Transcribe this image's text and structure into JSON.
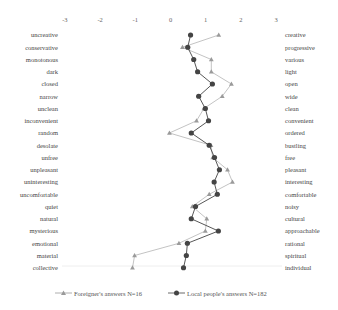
{
  "chart_data": {
    "type": "line",
    "subtype": "semantic-differential",
    "title": "",
    "xlabel": "",
    "ylabel": "",
    "xlim": [
      -3,
      3
    ],
    "x_ticks": [
      "-3",
      "-2",
      "-1",
      "0",
      "1",
      "2",
      "3"
    ],
    "grid": false,
    "legend_position": "bottom",
    "left_labels": [
      "uncreative",
      "conservative",
      "monotonous",
      "dark",
      "closed",
      "narrow",
      "unclean",
      "inconvenient",
      "random",
      "desolate",
      "unfree",
      "unpleasant",
      "uninteresting",
      "uncomfortable",
      "quiet",
      "natural",
      "mysterious",
      "emotional",
      "material",
      "collective"
    ],
    "right_labels": [
      "creative",
      "progressive",
      "various",
      "light",
      "open",
      "wide",
      "clean",
      "convenient",
      "ordered",
      "bustling",
      "free",
      "pleasant",
      "interesting",
      "comfortable",
      "noisy",
      "cultural",
      "approachable",
      "rational",
      "spiritual",
      "individual"
    ],
    "series": [
      {
        "name": "Foreigner's answers N=16",
        "marker": "triangle",
        "color": "#9a9a9a",
        "values": [
          1.37,
          0.34,
          1.16,
          1.16,
          1.73,
          1.47,
          0.95,
          0.74,
          -0.03,
          1.15,
          1.2,
          1.62,
          1.76,
          1.1,
          0.62,
          1.03,
          0.99,
          0.24,
          -1.02,
          -1.08
        ]
      },
      {
        "name": "Local people's answers N=182",
        "marker": "circle",
        "color": "#444444",
        "values": [
          0.57,
          0.49,
          0.66,
          0.77,
          1.19,
          0.8,
          0.99,
          1.08,
          0.59,
          1.1,
          1.25,
          1.39,
          1.24,
          1.33,
          0.71,
          0.59,
          1.36,
          0.48,
          0.45,
          0.37
        ]
      }
    ]
  },
  "legend": {
    "foreigner": "Foreigner's answers N=16",
    "local": "Local people's answers N=182"
  }
}
